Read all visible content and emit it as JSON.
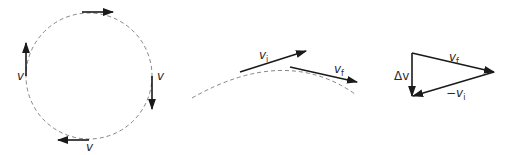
{
  "panels": {
    "circle": {
      "labels": {
        "left": "v",
        "right": "v",
        "bottom": "v"
      }
    },
    "arc": {
      "labels": {
        "initial": "v",
        "initial_sub": "i",
        "final": "v",
        "final_sub": "f"
      }
    },
    "triangle": {
      "labels": {
        "delta": "Δv",
        "final": "v",
        "final_sub": "f",
        "neg_initial": "−v",
        "neg_initial_sub": "i"
      }
    }
  },
  "colors": {
    "vector": "#1a1a1a",
    "path": "#777777",
    "text": "#2a2a2a",
    "background": "#ffffff"
  }
}
